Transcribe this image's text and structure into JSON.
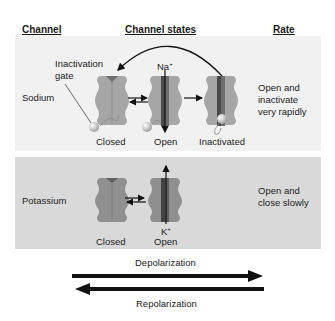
{
  "headers": {
    "channel": "Channel",
    "states": "Channel states",
    "rate": "Rate"
  },
  "sodium": {
    "name": "Sodium",
    "gate_label_line1": "Inactivation",
    "gate_label_line2": "gate",
    "ion": "Na+",
    "ion_base": "Na",
    "ion_sup": "+",
    "states": [
      "Closed",
      "Open",
      "Inactivated"
    ],
    "rate_line1": "Open and",
    "rate_line2": "inactivate",
    "rate_line3": "very rapidly"
  },
  "potassium": {
    "name": "Potassium",
    "ion": "K+",
    "ion_base": "K",
    "ion_sup": "+",
    "states": [
      "Closed",
      "Open"
    ],
    "rate_line1": "Open and",
    "rate_line2": "close slowly"
  },
  "arrows": {
    "forward": "Depolarization",
    "backward": "Repolarization"
  },
  "colors": {
    "channel_body": "#a6a6a6",
    "channel_pore": "#6e6e6e",
    "channel_pore_dark": "#4a4a4a",
    "gate_ball": "#e6e6e6",
    "panel_sodium": "#f1f1f1",
    "panel_potassium": "#d9d9d9"
  }
}
